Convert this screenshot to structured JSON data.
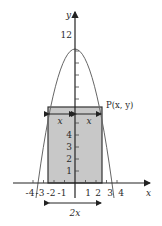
{
  "figure": {
    "axes": {
      "x_label": "x",
      "y_label": "y",
      "x_ticks": [
        "-4",
        "-3",
        "-2",
        "-1",
        "1",
        "2",
        "3",
        "4"
      ],
      "y_ticks": [
        "1",
        "2",
        "3",
        "4"
      ],
      "y_top_label": "12"
    },
    "point_label": "P(x, y)",
    "half_width_labels": [
      "x",
      "x"
    ],
    "width_label": "2x",
    "colors": {
      "curve": "#555555",
      "rectangle_fill": "#c8c8c8",
      "rectangle_stroke": "#333333",
      "axis": "#222222"
    }
  }
}
